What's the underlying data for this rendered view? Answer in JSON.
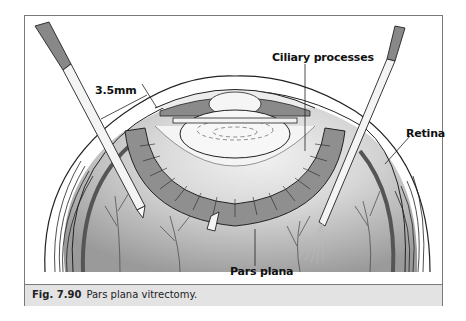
{
  "figure": {
    "labels": {
      "dimension": "3.5mm",
      "ciliary_processes": "Ciliary processes",
      "retina": "Retina",
      "pars_plana": "Pars plana"
    },
    "caption": {
      "number": "Fig. 7.90",
      "text": "Pars plana vitrectomy."
    },
    "colors": {
      "frame": "#7a7a7a",
      "caption_band": "#e3e3e3",
      "tissue_gray": "#8f8f8f",
      "vitreous_gray": "#a9a9a9",
      "sclera_light": "#e9e9e9"
    }
  }
}
